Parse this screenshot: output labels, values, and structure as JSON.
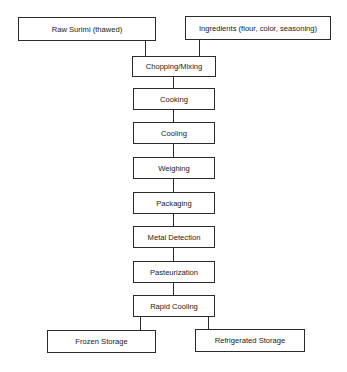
{
  "diagram": {
    "type": "process-flowchart",
    "inputs": [
      {
        "id": "raw-surimi",
        "label": "Raw Surimi (thawed)"
      },
      {
        "id": "ingredients",
        "label": "Ingredients (flour, color, seasoning)"
      }
    ],
    "steps": [
      {
        "id": "chopping-mixing",
        "label": "Chopping/Mixing"
      },
      {
        "id": "cooking",
        "label": "Cooking"
      },
      {
        "id": "cooling",
        "label": "Cooling"
      },
      {
        "id": "weighing",
        "label": "Weighing"
      },
      {
        "id": "packaging",
        "label": "Packaging"
      },
      {
        "id": "metal-detection",
        "label": "Metal Detection"
      },
      {
        "id": "pasteurization",
        "label": "Pasteurization"
      },
      {
        "id": "rapid-cooling",
        "label": "Rapid Cooling"
      }
    ],
    "outputs": [
      {
        "id": "frozen-storage",
        "label": "Frozen Storage"
      },
      {
        "id": "refrigerated-storage",
        "label": "Refrigerated Storage"
      }
    ],
    "edges": [
      [
        "raw-surimi",
        "chopping-mixing"
      ],
      [
        "ingredients",
        "chopping-mixing"
      ],
      [
        "chopping-mixing",
        "cooking"
      ],
      [
        "cooking",
        "cooling"
      ],
      [
        "cooling",
        "weighing"
      ],
      [
        "weighing",
        "packaging"
      ],
      [
        "packaging",
        "metal-detection"
      ],
      [
        "metal-detection",
        "pasteurization"
      ],
      [
        "pasteurization",
        "rapid-cooling"
      ],
      [
        "rapid-cooling",
        "frozen-storage"
      ],
      [
        "rapid-cooling",
        "refrigerated-storage"
      ]
    ]
  }
}
